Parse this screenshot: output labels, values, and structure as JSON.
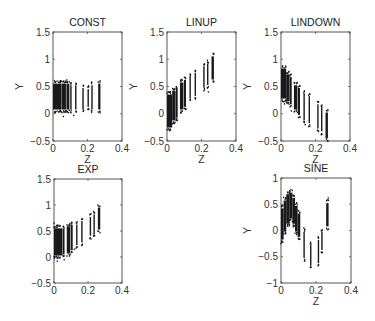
{
  "chart_data": [
    {
      "type": "scatter",
      "title": "CONST",
      "xlabel": "Z",
      "ylabel": "Y",
      "xlim": [
        0,
        0.4
      ],
      "ylim": [
        -0.5,
        1.5
      ],
      "xticks": [
        "0",
        "0.2",
        "0.4"
      ],
      "yticks": [
        "-0.5",
        "0",
        "0.5",
        "1",
        "1.5"
      ],
      "grid": false,
      "legend": null,
      "frame": {
        "x": 53,
        "y": 32,
        "w": 69,
        "h": 109
      },
      "clusters": [
        {
          "z0": 0.0,
          "z1": 0.05,
          "ymin": 0.05,
          "ymax": 0.58
        },
        {
          "z0": 0.052,
          "z1": 0.075,
          "ymin": 0.05,
          "ymax": 0.58
        },
        {
          "z0": 0.078,
          "z1": 0.095,
          "ymin": 0.05,
          "ymax": 0.58
        },
        {
          "z0": 0.1,
          "z1": 0.106,
          "ymin": 0.05,
          "ymax": 0.55
        },
        {
          "z0": 0.128,
          "z1": 0.133,
          "ymin": 0.05,
          "ymax": 0.55
        },
        {
          "z0": 0.17,
          "z1": 0.175,
          "ymin": 0.05,
          "ymax": 0.5
        },
        {
          "z0": 0.2,
          "z1": 0.205,
          "ymin": 0.1,
          "ymax": 0.48
        },
        {
          "z0": 0.222,
          "z1": 0.228,
          "ymin": 0.05,
          "ymax": 0.55
        },
        {
          "z0": 0.262,
          "z1": 0.275,
          "ymin": 0.05,
          "ymax": 0.58
        }
      ],
      "outliers": [
        [
          0.06,
          -0.05
        ],
        [
          0.09,
          0.02
        ],
        [
          0.12,
          -0.03
        ],
        [
          0.27,
          0.04
        ],
        [
          0.08,
          0.62
        ]
      ]
    },
    {
      "type": "scatter",
      "title": "LINUP",
      "xlabel": "Z",
      "ylabel": "Y",
      "xlim": [
        0,
        0.4
      ],
      "ylim": [
        -0.5,
        1.5
      ],
      "xticks": [
        "0",
        "0.2",
        "0.4"
      ],
      "yticks": [
        "-0.5",
        "0",
        "0.5",
        "1",
        "1.5"
      ],
      "grid": false,
      "legend": null,
      "frame": {
        "x": 167,
        "y": 32,
        "w": 69,
        "h": 109
      },
      "clusters": [
        {
          "z0": 0.0,
          "z1": 0.03,
          "ymin": -0.28,
          "ymax": 0.38
        },
        {
          "z0": 0.03,
          "z1": 0.05,
          "ymin": -0.15,
          "ymax": 0.45
        },
        {
          "z0": 0.052,
          "z1": 0.062,
          "ymin": -0.1,
          "ymax": 0.5
        },
        {
          "z0": 0.075,
          "z1": 0.095,
          "ymin": 0.05,
          "ymax": 0.6
        },
        {
          "z0": 0.098,
          "z1": 0.11,
          "ymin": 0.1,
          "ymax": 0.65
        },
        {
          "z0": 0.13,
          "z1": 0.135,
          "ymin": 0.25,
          "ymax": 0.72
        },
        {
          "z0": 0.16,
          "z1": 0.166,
          "ymin": 0.3,
          "ymax": 0.78
        },
        {
          "z0": 0.21,
          "z1": 0.216,
          "ymin": 0.45,
          "ymax": 0.9
        },
        {
          "z0": 0.232,
          "z1": 0.238,
          "ymin": 0.5,
          "ymax": 0.95
        },
        {
          "z0": 0.258,
          "z1": 0.272,
          "ymin": 0.6,
          "ymax": 1.08
        }
      ],
      "outliers": [
        [
          0.24,
          0.4
        ],
        [
          0.06,
          -0.12
        ],
        [
          0.11,
          0.08
        ]
      ]
    },
    {
      "type": "scatter",
      "title": "LINDOWN",
      "xlabel": "Z",
      "ylabel": "Y",
      "xlim": [
        0,
        0.4
      ],
      "ylim": [
        -0.5,
        1.5
      ],
      "xticks": [
        "0",
        "0.2",
        "0.4"
      ],
      "yticks": [
        "-0.5",
        "0",
        "0.5",
        "1",
        "1.5"
      ],
      "grid": false,
      "legend": null,
      "frame": {
        "x": 281,
        "y": 32,
        "w": 69,
        "h": 109
      },
      "clusters": [
        {
          "z0": 0.0,
          "z1": 0.03,
          "ymin": 0.25,
          "ymax": 0.85
        },
        {
          "z0": 0.03,
          "z1": 0.05,
          "ymin": 0.2,
          "ymax": 0.75
        },
        {
          "z0": 0.052,
          "z1": 0.062,
          "ymin": 0.15,
          "ymax": 0.7
        },
        {
          "z0": 0.075,
          "z1": 0.095,
          "ymin": 0.05,
          "ymax": 0.55
        },
        {
          "z0": 0.098,
          "z1": 0.11,
          "ymin": -0.05,
          "ymax": 0.5
        },
        {
          "z0": 0.13,
          "z1": 0.135,
          "ymin": -0.15,
          "ymax": 0.4
        },
        {
          "z0": 0.16,
          "z1": 0.166,
          "ymin": -0.2,
          "ymax": 0.35
        },
        {
          "z0": 0.21,
          "z1": 0.216,
          "ymin": -0.3,
          "ymax": 0.2
        },
        {
          "z0": 0.232,
          "z1": 0.238,
          "ymin": -0.35,
          "ymax": 0.15
        },
        {
          "z0": 0.258,
          "z1": 0.272,
          "ymin": -0.48,
          "ymax": 0.05
        }
      ],
      "outliers": [
        [
          0.02,
          0.18
        ],
        [
          0.14,
          -0.2
        ],
        [
          0.06,
          0.05
        ]
      ]
    },
    {
      "type": "scatter",
      "title": "EXP",
      "xlabel": "",
      "ylabel": "",
      "xlim": [
        0,
        0.4
      ],
      "ylim": [
        -0.5,
        1.5
      ],
      "xticks": [
        "0",
        "0.2",
        "0.4"
      ],
      "yticks": [
        "-0.5",
        "0",
        "0.5",
        "1",
        "1.5"
      ],
      "grid": false,
      "legend": null,
      "frame": {
        "x": 54,
        "y": 179,
        "w": 68,
        "h": 104
      },
      "clusters": [
        {
          "z0": 0.0,
          "z1": 0.05,
          "ymin": 0.0,
          "ymax": 0.58
        },
        {
          "z0": 0.052,
          "z1": 0.062,
          "ymin": 0.02,
          "ymax": 0.58
        },
        {
          "z0": 0.075,
          "z1": 0.095,
          "ymin": 0.05,
          "ymax": 0.62
        },
        {
          "z0": 0.098,
          "z1": 0.11,
          "ymin": 0.1,
          "ymax": 0.65
        },
        {
          "z0": 0.13,
          "z1": 0.135,
          "ymin": 0.2,
          "ymax": 0.65
        },
        {
          "z0": 0.16,
          "z1": 0.166,
          "ymin": 0.25,
          "ymax": 0.72
        },
        {
          "z0": 0.21,
          "z1": 0.216,
          "ymin": 0.38,
          "ymax": 0.8
        },
        {
          "z0": 0.232,
          "z1": 0.238,
          "ymin": 0.4,
          "ymax": 0.85
        },
        {
          "z0": 0.258,
          "z1": 0.272,
          "ymin": 0.5,
          "ymax": 0.98
        }
      ],
      "outliers": [
        [
          0.02,
          -0.08
        ],
        [
          0.06,
          -0.05
        ],
        [
          0.12,
          0.15
        ],
        [
          0.0,
          0.65
        ]
      ]
    },
    {
      "type": "scatter",
      "title": "SINE",
      "xlabel": "Z",
      "ylabel": "Y",
      "xlim": [
        0,
        0.4
      ],
      "ylim": [
        -1,
        1
      ],
      "xticks": [
        "0",
        "0.2",
        "0.4"
      ],
      "yticks": [
        "-1",
        "-0.5",
        "0",
        "0.5",
        "1"
      ],
      "grid": false,
      "legend": null,
      "frame": {
        "x": 281,
        "y": 178,
        "w": 70,
        "h": 105
      },
      "clusters": [
        {
          "z0": 0.0,
          "z1": 0.015,
          "ymin": -0.2,
          "ymax": 0.45
        },
        {
          "z0": 0.015,
          "z1": 0.03,
          "ymin": -0.05,
          "ymax": 0.6
        },
        {
          "z0": 0.03,
          "z1": 0.05,
          "ymin": 0.1,
          "ymax": 0.72
        },
        {
          "z0": 0.05,
          "z1": 0.065,
          "ymin": 0.2,
          "ymax": 0.75
        },
        {
          "z0": 0.065,
          "z1": 0.08,
          "ymin": 0.1,
          "ymax": 0.65
        },
        {
          "z0": 0.08,
          "z1": 0.095,
          "ymin": -0.05,
          "ymax": 0.5
        },
        {
          "z0": 0.095,
          "z1": 0.11,
          "ymin": -0.15,
          "ymax": 0.35
        },
        {
          "z0": 0.128,
          "z1": 0.134,
          "ymin": -0.55,
          "ymax": 0.0
        },
        {
          "z0": 0.166,
          "z1": 0.172,
          "ymin": -0.7,
          "ymax": -0.25
        },
        {
          "z0": 0.21,
          "z1": 0.216,
          "ymin": -0.65,
          "ymax": -0.15
        },
        {
          "z0": 0.23,
          "z1": 0.236,
          "ymin": -0.4,
          "ymax": 0.0
        },
        {
          "z0": 0.258,
          "z1": 0.272,
          "ymin": 0.05,
          "ymax": 0.55
        }
      ],
      "outliers": [
        [
          0.27,
          0.62
        ],
        [
          0.0,
          -0.25
        ],
        [
          0.13,
          0.05
        ]
      ]
    }
  ]
}
